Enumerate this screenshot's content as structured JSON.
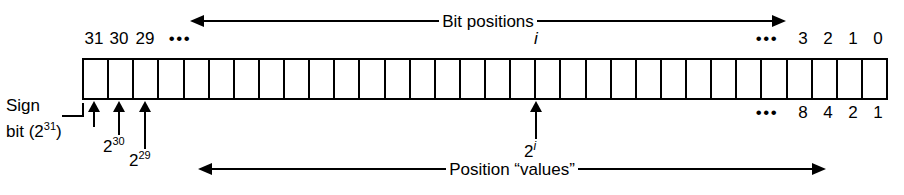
{
  "figure": {
    "bit_count": 32,
    "colors": {
      "ink": "#000000",
      "background": "#ffffff"
    }
  },
  "top_caption": {
    "text": "Bit positions",
    "arrow_left": "arrow-left",
    "arrow_right": "arrow-right"
  },
  "bottom_caption": {
    "text": "Position “values”",
    "arrow_left": "arrow-left",
    "arrow_right": "arrow-right"
  },
  "top_labels": {
    "left": [
      "31",
      "30",
      "29"
    ],
    "left_ellipsis": "•••",
    "center_index": "i",
    "right_ellipsis": "•••",
    "right": [
      "3",
      "2",
      "1",
      "0"
    ]
  },
  "bottom_labels": {
    "ellipsis": "•••",
    "values": [
      "8",
      "4",
      "2",
      "1"
    ]
  },
  "annotations": {
    "sign_bit": {
      "line1": "Sign",
      "line2_prefix": "bit (2",
      "line2_exponent": "31",
      "line2_suffix": ")"
    },
    "pow30": {
      "base": "2",
      "exponent": "30"
    },
    "pow29": {
      "base": "2",
      "exponent": "29"
    },
    "pow_i": {
      "base": "2",
      "exponent": "i"
    }
  }
}
